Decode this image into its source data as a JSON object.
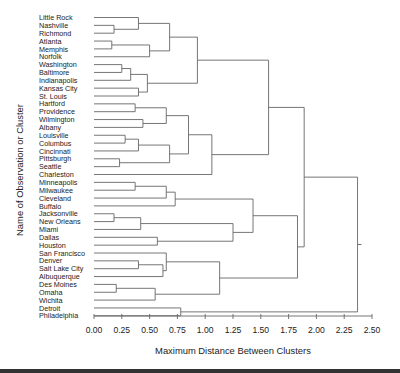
{
  "chart_data": {
    "type": "dendrogram",
    "title": "",
    "xlabel": "Maximum Distance Between Clusters",
    "ylabel": "Name of Observation or Cluster",
    "xlim": [
      0,
      2.5
    ],
    "x_ticks": [
      "0.00",
      "0.25",
      "0.50",
      "0.75",
      "1.00",
      "1.25",
      "1.50",
      "1.75",
      "2.00",
      "2.25",
      "2.50"
    ],
    "leaves": [
      "Little Rock",
      "Nashville",
      "Richmond",
      "Atlanta",
      "Memphis",
      "Norfolk",
      "Washington",
      "Baltimore",
      "Indianapolis",
      "Kansas City",
      "St. Louis",
      "Hartford",
      "Providence",
      "Wilmington",
      "Albany",
      "Louisville",
      "Columbus",
      "Cincinnati",
      "Pittsburgh",
      "Seattle",
      "Charleston",
      "Minneapolis",
      "Milwaukee",
      "Cleveland",
      "Buffalo",
      "Jacksonville",
      "New Orleans",
      "Miami",
      "Dallas",
      "Houston",
      "San Francisco",
      "Denver",
      "Salt Lake City",
      "Albuquerque",
      "Des Moines",
      "Omaha",
      "Wichita",
      "Detroit",
      "Philadelphia"
    ],
    "merges": [
      {
        "id": "c1",
        "left": "Nashville",
        "right": "Richmond",
        "height": 0.18
      },
      {
        "id": "c2",
        "left": "Little Rock",
        "right": "c1",
        "height": 0.4
      },
      {
        "id": "c3",
        "left": "Atlanta",
        "right": "Memphis",
        "height": 0.16
      },
      {
        "id": "c4",
        "left": "c3",
        "right": "Norfolk",
        "height": 0.5
      },
      {
        "id": "c5",
        "left": "c2",
        "right": "c4",
        "height": 0.68
      },
      {
        "id": "c6",
        "left": "Washington",
        "right": "Baltimore",
        "height": 0.25
      },
      {
        "id": "c7",
        "left": "c6",
        "right": "Indianapolis",
        "height": 0.33
      },
      {
        "id": "c8",
        "left": "Kansas City",
        "right": "St. Louis",
        "height": 0.4
      },
      {
        "id": "c9",
        "left": "c7",
        "right": "c8",
        "height": 0.48
      },
      {
        "id": "c10",
        "left": "c5",
        "right": "c9",
        "height": 0.93
      },
      {
        "id": "c11",
        "left": "Hartford",
        "right": "Providence",
        "height": 0.37
      },
      {
        "id": "c12",
        "left": "Wilmington",
        "right": "Albany",
        "height": 0.44
      },
      {
        "id": "c13",
        "left": "c11",
        "right": "c12",
        "height": 0.65
      },
      {
        "id": "c14",
        "left": "Louisville",
        "right": "Columbus",
        "height": 0.28
      },
      {
        "id": "c15",
        "left": "c14",
        "right": "Cincinnati",
        "height": 0.4
      },
      {
        "id": "c16",
        "left": "Pittsburgh",
        "right": "Seattle",
        "height": 0.23
      },
      {
        "id": "c17",
        "left": "c15",
        "right": "c16",
        "height": 0.68
      },
      {
        "id": "c18",
        "left": "c13",
        "right": "c17",
        "height": 0.85
      },
      {
        "id": "c19",
        "left": "c18",
        "right": "Charleston",
        "height": 1.06
      },
      {
        "id": "c20",
        "left": "c10",
        "right": "c19",
        "height": 1.57
      },
      {
        "id": "c21",
        "left": "Minneapolis",
        "right": "Milwaukee",
        "height": 0.37
      },
      {
        "id": "c22",
        "left": "c21",
        "right": "Cleveland",
        "height": 0.65
      },
      {
        "id": "c23",
        "left": "c22",
        "right": "Buffalo",
        "height": 0.73
      },
      {
        "id": "c24",
        "left": "Jacksonville",
        "right": "New Orleans",
        "height": 0.18
      },
      {
        "id": "c25",
        "left": "c24",
        "right": "Miami",
        "height": 0.42
      },
      {
        "id": "c26",
        "left": "Dallas",
        "right": "Houston",
        "height": 0.57
      },
      {
        "id": "c27",
        "left": "c25",
        "right": "c26",
        "height": 1.25
      },
      {
        "id": "c28",
        "left": "c23",
        "right": "c27",
        "height": 1.43
      },
      {
        "id": "c29",
        "left": "Denver",
        "right": "Salt Lake City",
        "height": 0.4
      },
      {
        "id": "c30",
        "left": "c29",
        "right": "Albuquerque",
        "height": 0.62
      },
      {
        "id": "c31",
        "left": "San Francisco",
        "right": "c30",
        "height": 0.65
      },
      {
        "id": "c32",
        "left": "Des Moines",
        "right": "Omaha",
        "height": 0.2
      },
      {
        "id": "c33",
        "left": "c32",
        "right": "Wichita",
        "height": 0.55
      },
      {
        "id": "c34",
        "left": "c31",
        "right": "c33",
        "height": 1.13
      },
      {
        "id": "c35",
        "left": "c28",
        "right": "c34",
        "height": 1.83
      },
      {
        "id": "c36",
        "left": "c20",
        "right": "c35",
        "height": 1.89
      },
      {
        "id": "c37",
        "left": "Detroit",
        "right": "Philadelphia",
        "height": 0.78
      },
      {
        "id": "c38",
        "left": "c36",
        "right": "c37",
        "height": 2.37
      }
    ],
    "grid": false,
    "legend": "none",
    "orientation": "horizontal",
    "line_color": "#666666"
  }
}
